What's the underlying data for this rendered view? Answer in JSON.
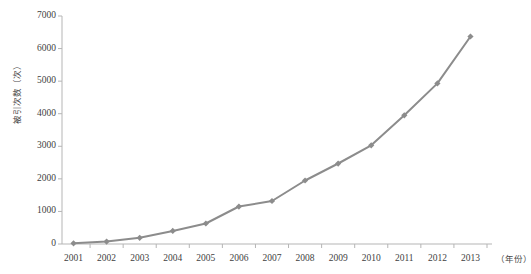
{
  "chart_data": {
    "type": "line",
    "title": "",
    "xlabel": "（年份）",
    "ylabel": "被引次数（次）",
    "categories": [
      "2001",
      "2002",
      "2003",
      "2004",
      "2005",
      "2006",
      "2007",
      "2008",
      "2009",
      "2010",
      "2011",
      "2012",
      "2013"
    ],
    "values": [
      20,
      75,
      190,
      400,
      630,
      1150,
      1320,
      1950,
      2470,
      3030,
      3950,
      4930,
      6370
    ],
    "series": [
      {
        "name": "被引次数",
        "values": [
          20,
          75,
          190,
          400,
          630,
          1150,
          1320,
          1950,
          2470,
          3030,
          3950,
          4930,
          6370
        ]
      }
    ],
    "ylim": [
      0,
      7000
    ],
    "y_ticks": [
      "0",
      "1000",
      "2000",
      "3000",
      "4000",
      "5000",
      "6000",
      "7000"
    ],
    "y_tick_values": [
      0,
      1000,
      2000,
      3000,
      4000,
      5000,
      6000,
      7000
    ],
    "grid": false,
    "legend": "none",
    "line_color": "#8c8c8c",
    "marker_color": "#8c8c8c",
    "marker_shape": "diamond",
    "axis_color": "#b5b5b5"
  }
}
